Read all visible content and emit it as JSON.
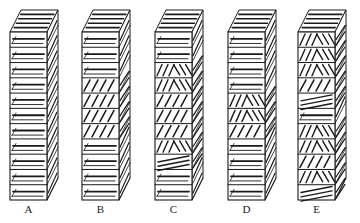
{
  "figure": {
    "stroke_color": "#1a1a1a",
    "background": "#ffffff"
  },
  "geometry": {
    "front_width": 37,
    "front_top": 32,
    "front_bottom": 200,
    "depth_dx": 11,
    "depth_dy": -22,
    "segments": 11
  },
  "stacks": [
    {
      "label": "A",
      "x": 10,
      "pattern": [
        "h",
        "h",
        "h",
        "h",
        "h",
        "h",
        "h",
        "h",
        "h",
        "h",
        "h"
      ]
    },
    {
      "label": "B",
      "x": 82,
      "pattern": [
        "h",
        "h",
        "h",
        "d",
        "d",
        "d",
        "d",
        "h",
        "h",
        "h",
        "h"
      ]
    },
    {
      "label": "C",
      "x": 155,
      "pattern": [
        "h",
        "h",
        "x",
        "x",
        "d",
        "d",
        "d",
        "x",
        "s",
        "h",
        "h"
      ]
    },
    {
      "label": "D",
      "x": 228,
      "pattern": [
        "h",
        "h",
        "h",
        "h",
        "x",
        "x",
        "d",
        "h",
        "h",
        "h",
        "h"
      ]
    },
    {
      "label": "E",
      "x": 298,
      "pattern": [
        "x",
        "x",
        "x",
        "d",
        "s",
        "h",
        "x",
        "x",
        "d",
        "x",
        "s"
      ]
    }
  ],
  "pattern_legend": {
    "h": "horizontal lamellae",
    "d": "diagonal lamellae",
    "x": "herringbone / crossed lamellae",
    "s": "shallow tilted lamellae"
  }
}
